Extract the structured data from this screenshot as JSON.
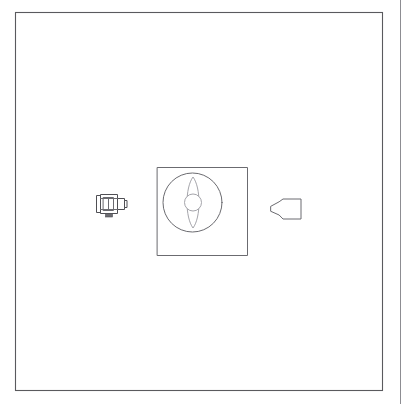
{
  "figure": {
    "title": "Technical line drawing figure",
    "background_color": "#ffffff",
    "line_color": "#5a5a5e",
    "light_line_color": "#9a9aa0",
    "page_rule": {
      "name": "page-edge-rule",
      "x": 400,
      "y1": 0,
      "y2": 404,
      "color": "#8d8d92"
    },
    "frame": {
      "label": "figure-border",
      "x": 15,
      "y": 12,
      "width": 367,
      "height": 378,
      "color": "#5a5a5e"
    },
    "parts": [
      {
        "id": "emitter",
        "label": "camera-projector-device",
        "description": "Small rectangular body with lens barrel facing right and a base stub",
        "x": 96,
        "y": 193,
        "width": 30,
        "height": 24,
        "orientation": "faces-right"
      },
      {
        "id": "target-assembly",
        "label": "square-housing",
        "description": "Square housing enclosing a circular aperture",
        "x": 157,
        "y": 167,
        "width": 91,
        "height": 89
      },
      {
        "id": "aperture-circle",
        "label": "circular-aperture",
        "description": "Large circle inside the square housing",
        "cx": 192.5,
        "cy": 202.5,
        "r": 29.5
      },
      {
        "id": "vane",
        "label": "vertical-lens-vane",
        "description": "Elongated pointed ellipse (lens shape) oriented vertically",
        "cx": 193,
        "cy": 202.5,
        "width": 16,
        "height": 51
      },
      {
        "id": "hub",
        "label": "center-hub-circle",
        "description": "Small circle at the centre of the vane",
        "cx": 193,
        "cy": 202.5,
        "r": 8.5
      },
      {
        "id": "nozzle",
        "label": "tapered-nozzle",
        "description": "Wedge / nozzle shape with narrow tip on the left and wider body on the right",
        "x": 271,
        "y": 199,
        "width": 30,
        "height": 20,
        "orientation": "tip-left"
      }
    ]
  }
}
